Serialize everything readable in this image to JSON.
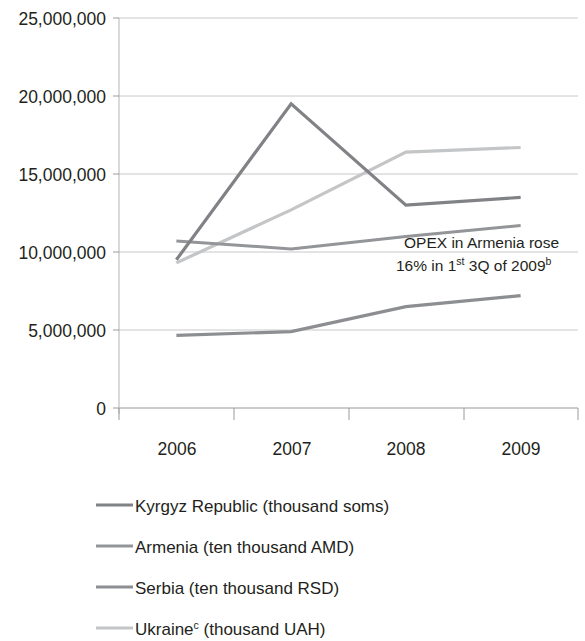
{
  "chart_data": {
    "type": "line",
    "title": "",
    "subtitle": "",
    "xlabel": "",
    "ylabel": "",
    "categories": [
      "2006",
      "2007",
      "2008",
      "2009"
    ],
    "x": [
      2006,
      2007,
      2008,
      2009
    ],
    "ylim": [
      0,
      25000000
    ],
    "ytick_values": [
      0,
      5000000,
      10000000,
      15000000,
      20000000,
      25000000
    ],
    "ytick_labels": [
      "0",
      "5,000,000",
      "10,000,000",
      "15,000,000",
      "20,000,000",
      "25,000,000"
    ],
    "xtick_labels": [
      "2006",
      "2007",
      "2008",
      "2009"
    ],
    "grid": true,
    "grid_axis": "y",
    "legend_position": "bottom-left",
    "series": [
      {
        "name": "Kyrgyz Republic (thousand soms)",
        "label_main": "Kyrgyz Republic (thousand soms)",
        "label_sup": "",
        "label_tail": "",
        "color": "#808285",
        "width": 3.2,
        "values": [
          9500000,
          19500000,
          13000000,
          13500000
        ]
      },
      {
        "name": "Armenia (ten thousand AMD)",
        "label_main": "Armenia (ten thousand AMD)",
        "label_sup": "",
        "label_tail": "",
        "color": "#939598",
        "width": 3.0,
        "values": [
          10700000,
          10200000,
          11000000,
          11700000
        ]
      },
      {
        "name": "Serbia (ten thousand RSD)",
        "label_main": "Serbia (ten thousand RSD)",
        "label_sup": "",
        "label_tail": "",
        "color": "#8c8e91",
        "width": 3.2,
        "values": [
          4650000,
          4900000,
          6500000,
          7200000
        ]
      },
      {
        "name": "Ukraine (thousand UAH)",
        "label_main": "Ukraine",
        "label_sup": "c",
        "label_tail": " (thousand UAH)",
        "color": "#c3c5c7",
        "width": 3.2,
        "values": [
          9300000,
          12700000,
          16400000,
          16700000
        ]
      }
    ],
    "annotations": [
      {
        "line1_main": "OPEX in Armenia rose",
        "line2_pre": "16% in 1",
        "line2_sup1": "st",
        "line2_mid": " 3Q of 2009",
        "line2_sup2": "b"
      }
    ]
  }
}
